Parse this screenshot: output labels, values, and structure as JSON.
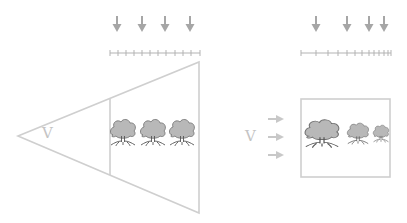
{
  "colors": {
    "outline": "#cfcfcf",
    "arrow": "#a6a6a6",
    "ruler": "#b3b3b3",
    "tree_fill": "#b8b8b8",
    "tree_stroke": "#6f6f6f",
    "side_arrow": "#c8c8c8",
    "label": "#c4c4c4"
  },
  "left_panel": {
    "label": "V",
    "shape": "perspective-frustum-triangle",
    "down_arrow_count": 4,
    "ruler_ticks": 12,
    "tree_count": 3,
    "tree_sizes": [
      "equal",
      "equal",
      "equal"
    ]
  },
  "right_panel": {
    "label": "V",
    "shape": "parallel-view-box",
    "down_arrow_count": 4,
    "ruler_ticks": 13,
    "side_arrow_count": 3,
    "tree_count": 3,
    "tree_sizes": [
      "large",
      "medium",
      "small"
    ]
  }
}
